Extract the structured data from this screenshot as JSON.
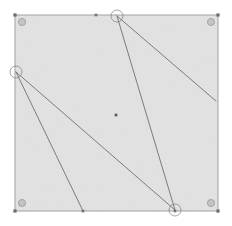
{
  "canvas": {
    "width": 232,
    "height": 226,
    "background_color": "#ffffff",
    "label": "geometry-figure-canvas"
  },
  "figure": {
    "bounding_box": {
      "name": "bounding-square",
      "x": 15,
      "y": 15,
      "width": 203,
      "height": 196,
      "fill_color": "#e2e2e2",
      "stroke_color": "#a8a8a8",
      "stroke_width": 1.1
    },
    "corner_markers": {
      "name": "corner-dot",
      "color": "#6d6d6d",
      "size": 3.2,
      "points": [
        {
          "label": "corner-top-left",
          "x": 15,
          "y": 15
        },
        {
          "label": "corner-top-right",
          "x": 218,
          "y": 15
        },
        {
          "label": "corner-bottom-left",
          "x": 15,
          "y": 211
        },
        {
          "label": "corner-bottom-right",
          "x": 218,
          "y": 211
        }
      ]
    },
    "corner_circles": {
      "name": "corner-circle-marker",
      "fill_color": "#c3c3c3",
      "stroke_color": "#9a9a9a",
      "radius": 3.6,
      "points": [
        {
          "label": "circle-top-left",
          "x": 22,
          "y": 22
        },
        {
          "label": "circle-top-right",
          "x": 211,
          "y": 22
        },
        {
          "label": "circle-bottom-left",
          "x": 22,
          "y": 203
        },
        {
          "label": "circle-bottom-right",
          "x": 211,
          "y": 203
        }
      ]
    },
    "edge_markers": {
      "name": "edge-point",
      "color": "#6d6d6d",
      "size": 2.6,
      "points": [
        {
          "label": "top-edge-point",
          "x": 96,
          "y": 15
        },
        {
          "label": "bottom-edge-point",
          "x": 83,
          "y": 211
        },
        {
          "label": "bottom-right-edge-point",
          "x": 175,
          "y": 211
        }
      ]
    },
    "center_point": {
      "name": "center-dot",
      "label": "centroid",
      "x": 116,
      "y": 115,
      "size": 2.6,
      "color": "#555555"
    },
    "vertices": [
      {
        "label": "vertex-top",
        "x": 117,
        "y": 16,
        "has_arc": true
      },
      {
        "label": "vertex-left",
        "x": 16,
        "y": 72,
        "has_arc": true
      },
      {
        "label": "vertex-bottom-right",
        "x": 175,
        "y": 210,
        "has_arc": true
      },
      {
        "label": "endpoint-right",
        "x": 216,
        "y": 101,
        "has_arc": false
      },
      {
        "label": "endpoint-bottom",
        "x": 83,
        "y": 211,
        "has_arc": false
      }
    ],
    "arc_markers": {
      "name": "angle-arc",
      "stroke_color": "#7a7a7a",
      "radius": 6,
      "fill_color": "none"
    },
    "segments": {
      "name": "figure-segment",
      "stroke_color": "#6f6f6f",
      "stroke_width": 0.9,
      "list": [
        {
          "label": "segment-top-to-bottomright",
          "x1": 117,
          "y1": 16,
          "x2": 175,
          "y2": 210
        },
        {
          "label": "segment-top-to-right",
          "x1": 117,
          "y1": 16,
          "x2": 216,
          "y2": 101
        },
        {
          "label": "segment-left-to-bottomright",
          "x1": 16,
          "y1": 72,
          "x2": 175,
          "y2": 210
        },
        {
          "label": "segment-left-to-bottom",
          "x1": 16,
          "y1": 72,
          "x2": 83,
          "y2": 211
        }
      ]
    }
  }
}
